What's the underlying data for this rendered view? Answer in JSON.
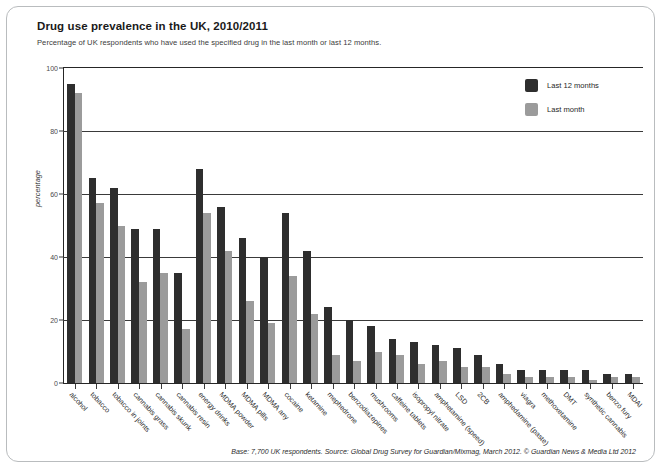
{
  "header": {
    "title": "Drug use prevalence in the UK, 2010/2011",
    "subtitle": "Percentage of UK respondents who have used the specified drug in the last month or last 12 months."
  },
  "footer": {
    "text": "Base: 7,700 UK respondents. Source: Global Drug Survey for Guardian/Mixmag,  March 2012. © Guardian News & Media Ltd 2012"
  },
  "legend": {
    "position": "top-right",
    "items": [
      {
        "label": "Last 12 months",
        "color": "#2e2e2e"
      },
      {
        "label": "Last month",
        "color": "#9b9b9b"
      }
    ]
  },
  "chart_data": {
    "type": "bar",
    "title": "Drug use prevalence in the UK, 2010/2011",
    "subtitle": "Percentage of UK respondents who have used the specified drug in the last month or last 12 months.",
    "xlabel": "",
    "ylabel": "percentage",
    "ylim": [
      0,
      100
    ],
    "yticks": [
      0,
      20,
      40,
      60,
      80,
      100
    ],
    "grid": true,
    "legend_position": "top-right",
    "categories": [
      "alcohol",
      "tobacco",
      "tobacco in joints",
      "cannabis grass",
      "cannabis skunk",
      "cannabis resin",
      "energy drinks",
      "MDMA powder",
      "MDMA pills",
      "MDMA any",
      "cocaine",
      "ketamine",
      "mephedrone",
      "benzodiazepines",
      "mushrooms",
      "caffeine tablets",
      "isopropyl nitrate",
      "amphetamine (speed)",
      "LSD",
      "2CB",
      "amphedamine (paste)",
      "viagra",
      "methoxetamine",
      "DMT",
      "synthetic cannabis",
      "benzo fury",
      "MDAI"
    ],
    "series": [
      {
        "name": "Last 12 months",
        "color": "#2e2e2e",
        "values": [
          95,
          65,
          62,
          49,
          49,
          35,
          68,
          56,
          46,
          40,
          54,
          42,
          24,
          20,
          18,
          14,
          13,
          12,
          11,
          9,
          6,
          4,
          4,
          4,
          4,
          3,
          3
        ]
      },
      {
        "name": "Last month",
        "color": "#9b9b9b",
        "values": [
          92,
          57,
          50,
          32,
          35,
          17,
          54,
          42,
          26,
          19,
          34,
          22,
          9,
          7,
          10,
          9,
          6,
          7,
          5,
          5,
          3,
          2,
          2,
          2,
          1,
          2,
          2
        ]
      }
    ]
  }
}
